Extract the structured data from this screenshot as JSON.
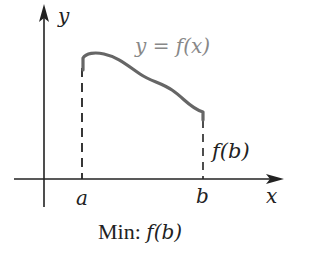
{
  "diagram": {
    "axis_labels": {
      "y": "y",
      "x": "x"
    },
    "tick_labels": {
      "a": "a",
      "b": "b"
    },
    "curve_label": "y = f(x)",
    "value_label": "f(b)",
    "caption": {
      "prefix": "Min: ",
      "value": "f(b)"
    },
    "colors": {
      "axes": "#222222",
      "curve": "#666666",
      "curve_label": "#888888"
    }
  }
}
